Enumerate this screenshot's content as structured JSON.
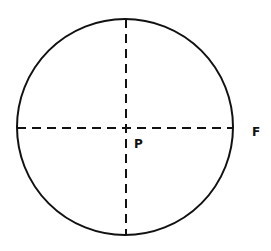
{
  "diagram": {
    "type": "circle-with-diameters",
    "shapes": [
      {
        "kind": "circle",
        "style": "solid"
      },
      {
        "kind": "diameter",
        "orientation": "vertical",
        "style": "dashed"
      },
      {
        "kind": "diameter",
        "orientation": "horizontal",
        "style": "dashed"
      }
    ],
    "labels": {
      "center": "P",
      "edge": "F"
    },
    "stroke_color": "#111111"
  }
}
